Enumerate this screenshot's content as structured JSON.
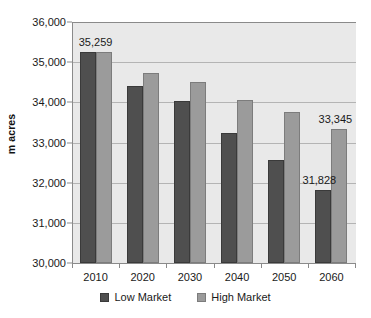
{
  "chart_data": {
    "type": "bar",
    "title": "",
    "subtitle": "",
    "xlabel": "",
    "ylabel": "m acres",
    "categories": [
      "2010",
      "2020",
      "2030",
      "2040",
      "2050",
      "2060"
    ],
    "series": [
      {
        "name": "Low Market",
        "color": "#4f4f4f",
        "values": [
          35259,
          34407,
          34033,
          33238,
          32565,
          31828
        ]
      },
      {
        "name": "High Market",
        "color": "#9b9b9b",
        "values": [
          35259,
          34730,
          34506,
          34060,
          33760,
          33345
        ]
      }
    ],
    "ylim": [
      30000,
      36000
    ],
    "ytick_step": 1000,
    "ytick_labels": [
      "36,000",
      "35,000",
      "34,000",
      "33,000",
      "32,000",
      "31,000",
      "30,000"
    ],
    "ytick_values": [
      36000,
      35000,
      34000,
      33000,
      32000,
      31000,
      30000
    ],
    "grid": true,
    "grid_axis": "y",
    "legend_position": "bottom",
    "plot_background": "#e9e9e9",
    "gridline_color": "#b4b4b4",
    "axis_color": "#8a8a8a",
    "annotations": [
      {
        "text": "35,259",
        "category": "2010",
        "series": "Low Market",
        "value": 35259
      },
      {
        "text": "33,345",
        "category": "2060",
        "series": "High Market",
        "value": 33345
      },
      {
        "text": "31,828",
        "category": "2060",
        "series": "Low Market",
        "value": 31828
      }
    ]
  }
}
